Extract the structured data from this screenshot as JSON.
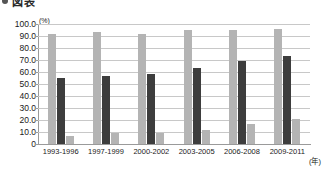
{
  "header": {
    "bullet_icon": "bullet-icon",
    "title": "図表"
  },
  "chart_data": {
    "type": "bar",
    "title": "図表",
    "xlabel": "(年)",
    "ylabel": "(%)",
    "ylim": [
      0,
      100
    ],
    "ytick_step": 10,
    "grid": true,
    "legend": "none",
    "categories": [
      "1993-1996",
      "1997-1999",
      "2000-2002",
      "2003-2005",
      "2006-2008",
      "2009-2011"
    ],
    "ytick_labels": [
      "100.0",
      "90.0",
      "80.0",
      "70.0",
      "60.0",
      "50.0",
      "40.0",
      "30.0",
      "20.0",
      "10.0",
      "0"
    ],
    "series": [
      {
        "name": "series-1",
        "color": "#b4b4b4",
        "values": [
          92.0,
          93.0,
          91.5,
          95.0,
          95.0,
          96.0
        ]
      },
      {
        "name": "series-2",
        "color": "#3d3d3d",
        "values": [
          55.0,
          57.0,
          58.0,
          63.0,
          69.0,
          73.0
        ]
      },
      {
        "name": "series-3",
        "color": "#b4b4b4",
        "values": [
          7.0,
          9.0,
          9.5,
          12.0,
          17.0,
          21.0
        ]
      }
    ]
  },
  "colors": {
    "series_light": "#b4b4b4",
    "series_dark": "#3d3d3d",
    "grid": "#c8c8c8",
    "axis": "#9a9a9a",
    "background": "#ffffff"
  }
}
